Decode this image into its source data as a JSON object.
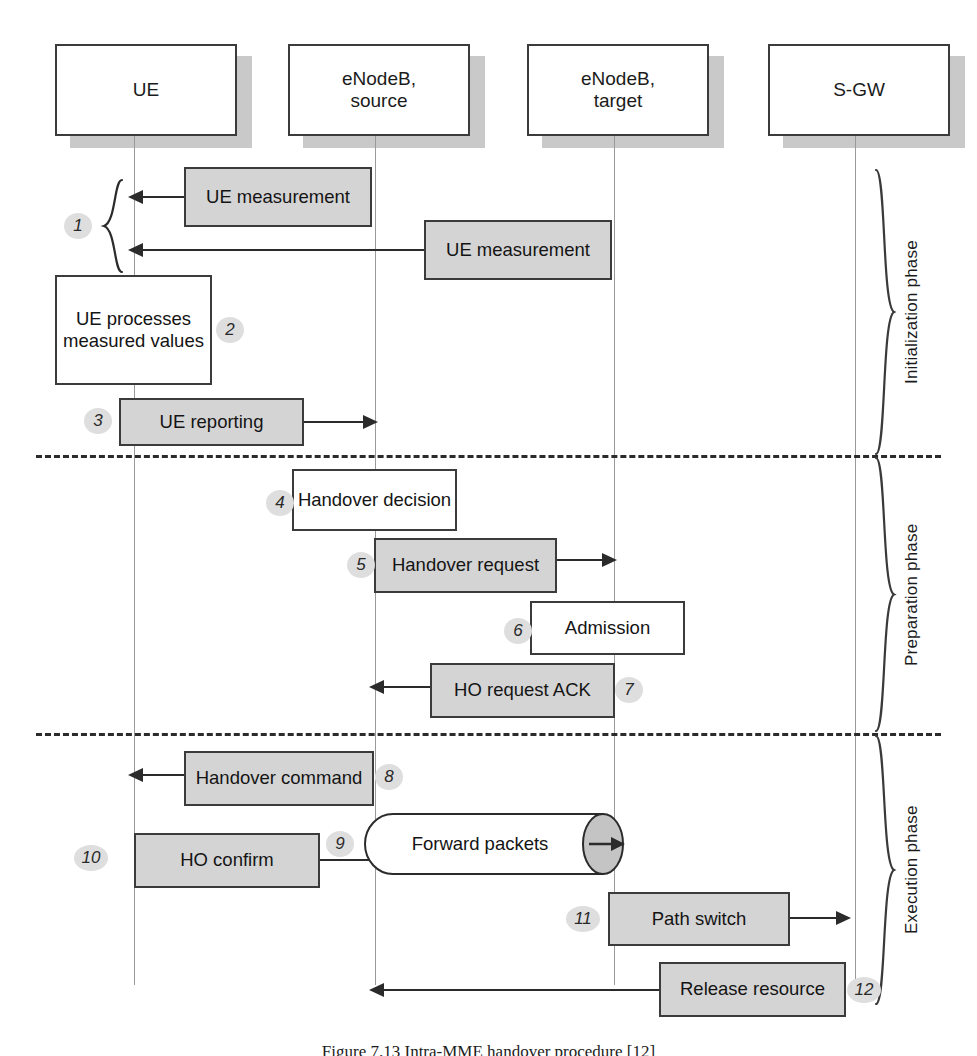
{
  "figure": {
    "caption": "Figure 7.13   Intra-MME handover procedure [12]"
  },
  "actors": [
    {
      "id": "ue",
      "label": "UE",
      "line1": "UE",
      "line2": ""
    },
    {
      "id": "enodeb-source",
      "label": "eNodeB, source",
      "line1": "eNodeB,",
      "line2": "source"
    },
    {
      "id": "enodeb-target",
      "label": "eNodeB, target",
      "line1": "eNodeB,",
      "line2": "target"
    },
    {
      "id": "sgw",
      "label": "S-GW",
      "line1": "S-GW",
      "line2": ""
    }
  ],
  "phases": [
    {
      "id": "initialization",
      "label": "Initialization phase"
    },
    {
      "id": "preparation",
      "label": "Preparation phase"
    },
    {
      "id": "execution",
      "label": "Execution phase"
    }
  ],
  "steps": [
    {
      "num": "1",
      "label": "UE measurement",
      "line1": "UE",
      "line2": "measurement",
      "kind": "message",
      "style": "filled",
      "from": "enodeb-source",
      "to": "ue",
      "phase": "initialization"
    },
    {
      "num": "1b",
      "label": "UE measurement",
      "line1": "UE",
      "line2": "measurement",
      "kind": "message",
      "style": "filled",
      "from": "enodeb-target",
      "to": "ue",
      "phase": "initialization"
    },
    {
      "num": "2",
      "label": "UE processes measured values",
      "line1": "UE",
      "line2": "processes",
      "line3": "measured",
      "line4": "values",
      "kind": "action",
      "style": "plain",
      "on": "ue",
      "phase": "initialization"
    },
    {
      "num": "3",
      "label": "UE reporting",
      "line1": "UE reporting",
      "line2": "",
      "kind": "message",
      "style": "filled",
      "from": "ue",
      "to": "enodeb-source",
      "phase": "initialization"
    },
    {
      "num": "4",
      "label": "Handover decision",
      "line1": "Handover",
      "line2": "decision",
      "kind": "action",
      "style": "plain",
      "on": "enodeb-source",
      "phase": "preparation"
    },
    {
      "num": "5",
      "label": "Handover request",
      "line1": "Handover",
      "line2": "request",
      "kind": "message",
      "style": "filled",
      "from": "enodeb-source",
      "to": "enodeb-target",
      "phase": "preparation"
    },
    {
      "num": "6",
      "label": "Admission",
      "line1": "Admission",
      "line2": "",
      "kind": "action",
      "style": "plain",
      "on": "enodeb-target",
      "phase": "preparation"
    },
    {
      "num": "7",
      "label": "HO request ACK",
      "line1": "HO request",
      "line2": "ACK",
      "kind": "message",
      "style": "filled",
      "from": "enodeb-target",
      "to": "enodeb-source",
      "phase": "preparation"
    },
    {
      "num": "8",
      "label": "Handover command",
      "line1": "Handover",
      "line2": "command",
      "kind": "message",
      "style": "filled",
      "from": "enodeb-source",
      "to": "ue",
      "phase": "execution"
    },
    {
      "num": "9",
      "label": "Forward packets",
      "line1": "Forward packets",
      "line2": "",
      "kind": "cylinder",
      "style": "filled",
      "from": "enodeb-source",
      "to": "enodeb-target",
      "phase": "execution"
    },
    {
      "num": "10",
      "label": "HO confirm",
      "line1": "HO confirm",
      "line2": "",
      "kind": "message",
      "style": "filled",
      "from": "ue",
      "to": "enodeb-target",
      "phase": "execution"
    },
    {
      "num": "11",
      "label": "Path switch",
      "line1": "Path switch",
      "line2": "",
      "kind": "message",
      "style": "filled",
      "from": "enodeb-target",
      "to": "sgw",
      "phase": "execution"
    },
    {
      "num": "12",
      "label": "Release resource",
      "line1": "Release",
      "line2": "resource",
      "kind": "message",
      "style": "filled",
      "from": "enodeb-target",
      "to": "enodeb-source",
      "phase": "execution"
    }
  ],
  "colors": {
    "message_fill": "#d4d4d4",
    "action_fill": "#ffffff",
    "stroke": "#3b3b3b",
    "arrow": "#2b2b2b",
    "lifeline": "#9a9a9a",
    "badge_fill": "#dedede",
    "shadow": "#c9c9c9",
    "background": "#ffffff"
  }
}
